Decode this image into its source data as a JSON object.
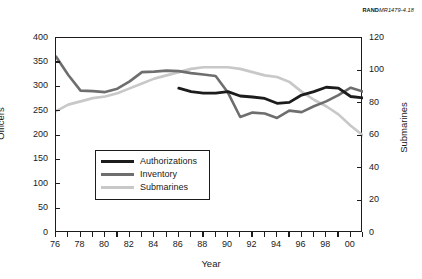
{
  "credit": {
    "brand": "RAND",
    "document": "MR1479-4.18"
  },
  "axes": {
    "left": {
      "title": "Officers",
      "ticks": [
        "400",
        "350",
        "300",
        "250",
        "200",
        "150",
        "100",
        "50",
        "0"
      ]
    },
    "right": {
      "title": "Submarines",
      "ticks": [
        "120",
        "100",
        "80",
        "60",
        "40",
        "20",
        "0"
      ]
    },
    "bottom": {
      "title": "Year",
      "ticks": [
        "76",
        "78",
        "80",
        "82",
        "84",
        "86",
        "88",
        "90",
        "92",
        "94",
        "96",
        "98",
        "00"
      ]
    }
  },
  "legend": {
    "items": [
      {
        "label": "Authorizations",
        "color": "#1c1c1c"
      },
      {
        "label": "Inventory",
        "color": "#6e6e6e"
      },
      {
        "label": "Submarines",
        "color": "#c8c8c8"
      }
    ]
  },
  "chart_data": {
    "type": "line",
    "title": "",
    "xlabel": "Year",
    "ylabel": "Officers",
    "y2label": "Submarines",
    "xlim": [
      1976,
      2001
    ],
    "ylim": [
      0,
      400
    ],
    "y2lim": [
      0,
      120
    ],
    "grid": false,
    "legend_position": "inside-lower-left",
    "x": [
      1976,
      1977,
      1978,
      1979,
      1980,
      1981,
      1982,
      1983,
      1984,
      1985,
      1986,
      1987,
      1988,
      1989,
      1990,
      1991,
      1992,
      1993,
      1994,
      1995,
      1996,
      1997,
      1998,
      1999,
      2000,
      2001
    ],
    "series": [
      {
        "name": "Authorizations",
        "axis": "left",
        "color": "#1c1c1c",
        "x": [
          1986,
          1987,
          1988,
          1989,
          1990,
          1991,
          1992,
          1993,
          1994,
          1995,
          1996,
          1997,
          1998,
          1999,
          2000,
          2001
        ],
        "values": [
          297,
          290,
          287,
          287,
          290,
          281,
          279,
          276,
          266,
          268,
          283,
          290,
          299,
          297,
          280,
          277
        ]
      },
      {
        "name": "Inventory",
        "axis": "left",
        "color": "#6e6e6e",
        "x": [
          1976,
          1977,
          1978,
          1979,
          1980,
          1981,
          1982,
          1983,
          1984,
          1985,
          1986,
          1987,
          1988,
          1989,
          1990,
          1991,
          1992,
          1993,
          1994,
          1995,
          1996,
          1997,
          1998,
          1999,
          2000,
          2001
        ],
        "values": [
          362,
          324,
          292,
          291,
          289,
          296,
          311,
          330,
          331,
          333,
          332,
          328,
          325,
          322,
          288,
          238,
          247,
          245,
          236,
          251,
          248,
          260,
          270,
          283,
          298,
          290
        ]
      },
      {
        "name": "Submarines",
        "axis": "right",
        "color": "#c8c8c8",
        "x": [
          1976,
          1977,
          1978,
          1979,
          1980,
          1981,
          1982,
          1983,
          1984,
          1985,
          1986,
          1987,
          1988,
          1989,
          1990,
          1991,
          1992,
          1993,
          1994,
          1995,
          1996,
          1997,
          1998,
          1999,
          2000,
          2001
        ],
        "values": [
          75,
          79,
          81,
          83,
          84,
          86,
          89,
          92,
          95,
          97,
          99,
          101,
          102,
          102,
          102,
          101,
          99,
          97,
          96,
          93,
          87,
          82,
          78,
          73,
          66,
          60
        ]
      }
    ]
  }
}
